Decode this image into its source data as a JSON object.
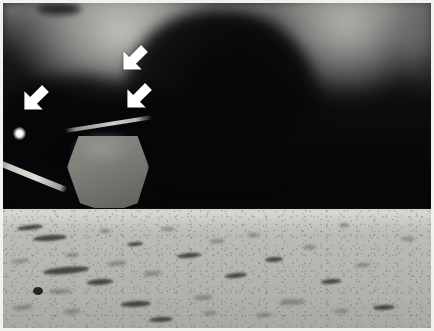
{
  "image": {
    "kind": "annotated-photograph",
    "subject": "lunar surface with spacecraft footpad and contact probe",
    "width_px": 434,
    "height_px": 331,
    "border_color": "#f2f1ee",
    "palette": {
      "sky_dark": "#0b0b0c",
      "sky_haze": "#b0b0ac",
      "glow": "#d0d0cb",
      "horizon": "#050506",
      "regolith_light": "#c3c3bd",
      "regolith_mid": "#b2b2ac",
      "rock_shadow": "#302d2d",
      "annotation": "#ffffff"
    }
  },
  "regions": {
    "sky": {
      "label": "shadowed upper region",
      "top_px": 0,
      "height_px": 209
    },
    "horizon": {
      "label": "horizon line",
      "y_px": 207
    },
    "ground": {
      "label": "lunar regolith surface",
      "top_px": 206,
      "height_px": 119
    }
  },
  "features": [
    {
      "name": "glow-patch-left",
      "label": "diffuse bright glow (left)",
      "x_px": 118,
      "y_px": 22
    },
    {
      "name": "glow-patch-right",
      "label": "diffuse bright glow (right)",
      "x_px": 343,
      "y_px": 22
    },
    {
      "name": "point-light",
      "label": "bright point of light",
      "x_px": 16,
      "y_px": 130
    },
    {
      "name": "landing-strut",
      "label": "diagonal landing strut",
      "x_px": 20,
      "y_px": 165
    },
    {
      "name": "contact-probe",
      "label": "contact probe rod",
      "x_px": 106,
      "y_px": 120
    },
    {
      "name": "footpad",
      "label": "spacecraft landing footpad",
      "x_px": 105,
      "y_px": 169
    },
    {
      "name": "foreground-rock",
      "label": "dark rock at right edge",
      "x_px": 410,
      "y_px": 256
    }
  ],
  "annotations": {
    "arrow_color": "#ffffff",
    "arrow_direction": "down-left",
    "count": 3,
    "arrows": [
      {
        "name": "arrow-top",
        "label": "arrow 1",
        "x_px": 117,
        "y_px": 36,
        "points_to": "glow-patch-left lower boundary"
      },
      {
        "name": "arrow-middle",
        "label": "arrow 2",
        "x_px": 121,
        "y_px": 74,
        "points_to": "shadow boundary above footpad"
      },
      {
        "name": "arrow-left",
        "label": "arrow 3",
        "x_px": 18,
        "y_px": 76,
        "points_to": "left shadow boundary"
      }
    ]
  },
  "rocks": [
    {
      "x": 14,
      "y": 16,
      "w": 26,
      "h": 5,
      "r": -6,
      "cls": "rock"
    },
    {
      "x": 30,
      "y": 26,
      "w": 34,
      "h": 6,
      "r": -4,
      "cls": "rock"
    },
    {
      "x": 8,
      "y": 50,
      "w": 18,
      "h": 4,
      "r": -8,
      "cls": "rock soft"
    },
    {
      "x": 40,
      "y": 58,
      "w": 46,
      "h": 7,
      "r": -5,
      "cls": "rock"
    },
    {
      "x": 62,
      "y": 44,
      "w": 14,
      "h": 4,
      "r": 0,
      "cls": "rock soft"
    },
    {
      "x": 30,
      "y": 78,
      "w": 10,
      "h": 8,
      "r": 0,
      "cls": "rock deep"
    },
    {
      "x": 46,
      "y": 80,
      "w": 22,
      "h": 5,
      "r": -3,
      "cls": "rock soft"
    },
    {
      "x": 84,
      "y": 70,
      "w": 26,
      "h": 6,
      "r": -4,
      "cls": "rock"
    },
    {
      "x": 104,
      "y": 52,
      "w": 20,
      "h": 5,
      "r": -6,
      "cls": "rock soft"
    },
    {
      "x": 96,
      "y": 20,
      "w": 12,
      "h": 4,
      "r": 0,
      "cls": "rock soft"
    },
    {
      "x": 124,
      "y": 33,
      "w": 16,
      "h": 4,
      "r": -5,
      "cls": "rock"
    },
    {
      "x": 140,
      "y": 62,
      "w": 18,
      "h": 5,
      "r": -4,
      "cls": "rock soft"
    },
    {
      "x": 158,
      "y": 18,
      "w": 14,
      "h": 4,
      "r": 0,
      "cls": "rock soft"
    },
    {
      "x": 174,
      "y": 44,
      "w": 24,
      "h": 5,
      "r": -5,
      "cls": "rock"
    },
    {
      "x": 190,
      "y": 86,
      "w": 20,
      "h": 5,
      "r": -4,
      "cls": "rock soft"
    },
    {
      "x": 118,
      "y": 92,
      "w": 30,
      "h": 6,
      "r": -3,
      "cls": "rock"
    },
    {
      "x": 60,
      "y": 100,
      "w": 18,
      "h": 5,
      "r": -4,
      "cls": "rock soft"
    },
    {
      "x": 206,
      "y": 30,
      "w": 16,
      "h": 4,
      "r": 0,
      "cls": "rock soft"
    },
    {
      "x": 222,
      "y": 64,
      "w": 22,
      "h": 5,
      "r": -6,
      "cls": "rock"
    },
    {
      "x": 244,
      "y": 24,
      "w": 12,
      "h": 4,
      "r": 0,
      "cls": "rock soft"
    },
    {
      "x": 262,
      "y": 48,
      "w": 18,
      "h": 5,
      "r": -4,
      "cls": "rock"
    },
    {
      "x": 276,
      "y": 90,
      "w": 26,
      "h": 6,
      "r": -3,
      "cls": "rock soft"
    },
    {
      "x": 300,
      "y": 36,
      "w": 14,
      "h": 4,
      "r": 0,
      "cls": "rock soft"
    },
    {
      "x": 318,
      "y": 70,
      "w": 20,
      "h": 5,
      "r": -5,
      "cls": "rock"
    },
    {
      "x": 336,
      "y": 14,
      "w": 10,
      "h": 4,
      "r": 0,
      "cls": "rock soft"
    },
    {
      "x": 352,
      "y": 54,
      "w": 16,
      "h": 4,
      "r": -4,
      "cls": "rock soft"
    },
    {
      "x": 370,
      "y": 96,
      "w": 22,
      "h": 5,
      "r": -3,
      "cls": "rock"
    },
    {
      "x": 252,
      "y": 104,
      "w": 18,
      "h": 4,
      "r": -4,
      "cls": "rock soft"
    },
    {
      "x": 146,
      "y": 108,
      "w": 24,
      "h": 5,
      "r": -3,
      "cls": "rock"
    },
    {
      "x": 398,
      "y": 28,
      "w": 14,
      "h": 4,
      "r": 0,
      "cls": "rock soft"
    },
    {
      "x": 10,
      "y": 96,
      "w": 20,
      "h": 5,
      "r": -5,
      "cls": "rock soft"
    },
    {
      "x": 200,
      "y": 102,
      "w": 14,
      "h": 4,
      "r": 0,
      "cls": "rock soft"
    },
    {
      "x": 330,
      "y": 100,
      "w": 16,
      "h": 4,
      "r": -3,
      "cls": "rock soft"
    }
  ]
}
